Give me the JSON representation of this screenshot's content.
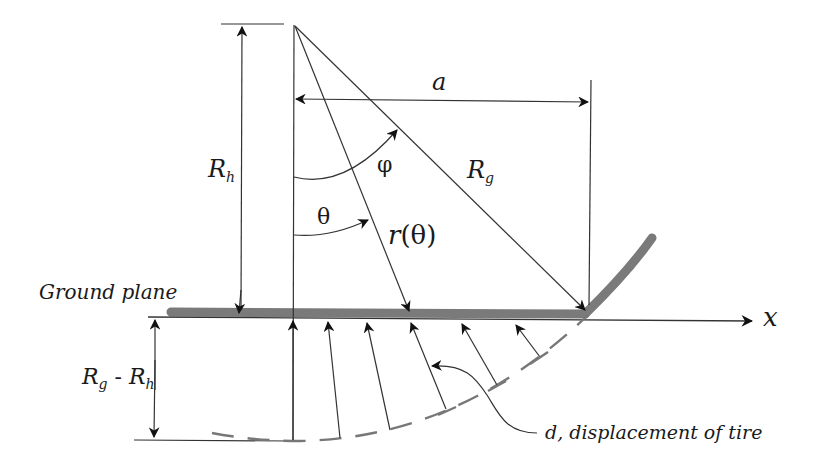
{
  "diagram": {
    "labels": {
      "a": "a",
      "phi": "φ",
      "theta": "θ",
      "r_theta_r": "r",
      "r_theta_arg": "(θ)",
      "Rh_main": "R",
      "Rh_sub": "h",
      "Rg_main": "R",
      "Rg_sub": "g",
      "ground_plane": "Ground plane",
      "x_axis": "x",
      "RgRh_R1": "R",
      "RgRh_sub1": "g",
      "RgRh_minus": " - ",
      "RgRh_R2": "R",
      "RgRh_sub2": "h",
      "d_callout": "d, displacement of tire"
    },
    "colors": {
      "line": "#333333",
      "tire": "#7a7a7a",
      "dashed_arc": "#777777",
      "text": "#1a1a1a"
    }
  }
}
